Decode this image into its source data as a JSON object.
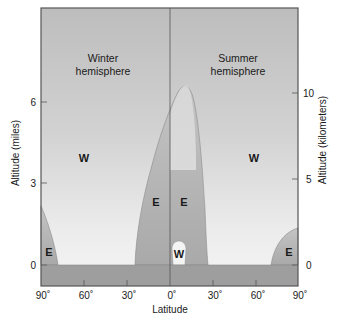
{
  "diagram": {
    "left_panel_title": [
      "Winter",
      "hemisphere"
    ],
    "right_panel_title": [
      "Summer",
      "hemisphere"
    ],
    "regions": {
      "winter_w": "W",
      "summer_w": "W",
      "equatorial_w": "W",
      "winter_polar_e": "E",
      "winter_tropical_e": "E",
      "summer_tropical_e": "E",
      "summer_polar_e": "E"
    },
    "x_axis": {
      "title": "Latitude",
      "ticks": [
        "90˚",
        "60˚",
        "30˚",
        "0˚",
        "30˚",
        "60˚",
        "90˚"
      ]
    },
    "y_axis_left": {
      "title": "Altitude (miles)",
      "ticks": [
        "0",
        "3",
        "6"
      ]
    },
    "y_axis_right": {
      "title": "Altitude (kilometers)",
      "ticks": [
        "0",
        "5",
        "10"
      ]
    },
    "colors": {
      "background_gray": "#c8c8c8",
      "light_region": "#f2f2f2",
      "ground": "#9c9c9c",
      "easterly_region": "#b4b4b4",
      "frame": "#555555"
    }
  }
}
